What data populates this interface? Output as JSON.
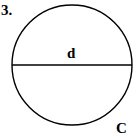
{
  "problem_number": "3.",
  "diagram": {
    "shape": "circle",
    "diameter_label": "d",
    "circumference_label": "C",
    "stroke_color": "#000000",
    "background": "#ffffff"
  }
}
